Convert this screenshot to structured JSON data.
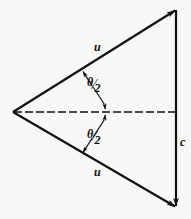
{
  "figure": {
    "type": "vector-velocity-triangle-diagram",
    "background_color": "#f7f7f5",
    "stroke_color": "#111111",
    "labels": {
      "upper_vector": "u",
      "lower_vector": "u",
      "resultant_vector": "c",
      "upper_angle_numerator": "θ",
      "upper_angle_bar": "⁄",
      "upper_angle_denominator": "2",
      "lower_angle_numerator": "θ",
      "lower_angle_bar": "⁄",
      "lower_angle_denominator": "2"
    },
    "geometry": {
      "apex_x": 13,
      "apex_y": 112,
      "top_right_x": 176,
      "top_right_y": 10,
      "bottom_right_x": 176,
      "bottom_right_y": 207,
      "axis_y": 112,
      "axis_dash_pattern": "8 3"
    }
  }
}
